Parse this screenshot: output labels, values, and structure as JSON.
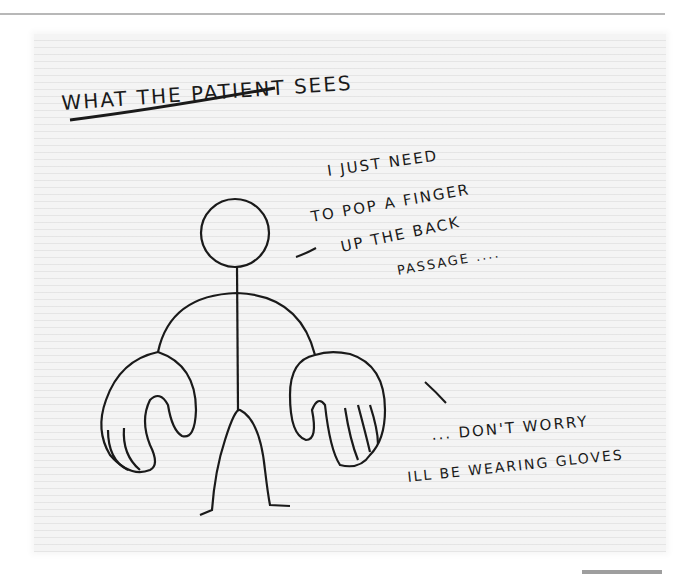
{
  "cartoon": {
    "title": "WHAT THE PATIENT SEES",
    "speech_top": {
      "lines": [
        "I JUST NEED",
        "TO POP A FINGER",
        "UP THE BACK",
        "PASSAGE ...."
      ]
    },
    "speech_bottom": {
      "lines": [
        "... DON'T WORRY",
        "ILL BE WEARING GLOVES"
      ]
    },
    "figure": "stick figure with oversized gloved hands",
    "colors": {
      "ink": "#1a1a1a",
      "paper": "#f4f4f4",
      "background": "#ffffff",
      "rule": "#b8b8b8"
    }
  }
}
